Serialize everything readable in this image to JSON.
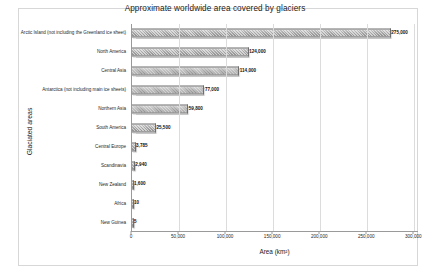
{
  "chart_data": {
    "type": "bar",
    "orientation": "horizontal",
    "title": "Approximate worldwide area covered by glaciers",
    "xlabel": "Area (km²)",
    "ylabel": "Glaciated areas",
    "xlim": [
      0,
      305000
    ],
    "grid": true,
    "legend": null,
    "categories": [
      "Arctic Island (not including the Greenland ice sheet)",
      "North America",
      "Central Asia",
      "Antarctica (not including main ice sheets)",
      "Northern Asia",
      "South America",
      "Central Europe",
      "Scandinavia",
      "New Zealand",
      "Africa",
      "New Guinea"
    ],
    "values": [
      275000,
      124000,
      114000,
      77000,
      59800,
      25500,
      3785,
      2940,
      1600,
      10,
      5
    ],
    "value_labels": [
      "275,000",
      "124,000",
      "114,000",
      "77,000",
      "59,800",
      "25,500",
      "3,785",
      "2,940",
      "1,600",
      "10",
      "5"
    ],
    "xticks": [
      0,
      50000,
      100000,
      150000,
      200000,
      250000,
      300000
    ],
    "xtick_labels": [
      "0",
      "50,000",
      "100,000",
      "150,000",
      "200,000",
      "250,000",
      "300,000"
    ],
    "bar_color": "#a8a8a8",
    "bar_edge_color": "#6e6e6e",
    "background_color": "#ffffff",
    "gridline_color": "#dcdcdc",
    "axis_color": "#9a9a9a"
  }
}
